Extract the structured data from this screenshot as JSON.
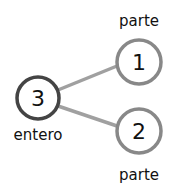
{
  "diagram": {
    "type": "number-bond",
    "whole": {
      "value": "3",
      "label": "entero",
      "stroke": "#444444"
    },
    "parts": [
      {
        "value": "1",
        "label": "parte",
        "stroke": "#888888"
      },
      {
        "value": "2",
        "label": "parte",
        "stroke": "#888888"
      }
    ],
    "connector_color": "#a0a0a0"
  }
}
